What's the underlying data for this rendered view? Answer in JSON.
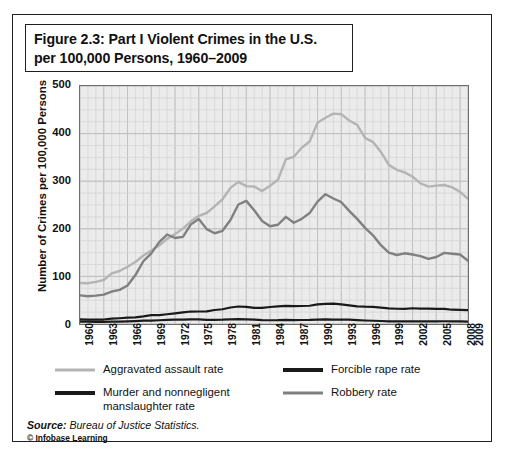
{
  "figure": {
    "title_line1": "Figure 2.3: Part I Violent Crimes in the U.S.",
    "title_line2": "per 100,000 Persons, 1960–2009",
    "source_prefix": "Source:",
    "source_text": " Bureau of Justice Statistics.",
    "copyright": "© Infobase Learning"
  },
  "colors": {
    "aggravated_assault": "#b4b4b4",
    "forcible_rape": "#1a1a1a",
    "murder": "#1a1a1a",
    "robbery": "#808080",
    "plot_background": "#ebebeb",
    "grid": "#d2d2d2",
    "axis": "#6d6d6d",
    "text": "#111111"
  },
  "legend": {
    "items": [
      {
        "label": "Aggravated assault rate",
        "color": "#b4b4b4",
        "width": 3
      },
      {
        "label": "Forcible rape rate",
        "color": "#1a1a1a",
        "width": 4
      },
      {
        "label": "Murder and nonnegligent\nmanslaughter rate",
        "color": "#1a1a1a",
        "width": 4
      },
      {
        "label": "Robbery rate",
        "color": "#808080",
        "width": 3
      }
    ]
  },
  "chart_data": {
    "type": "line",
    "title": "Figure 2.3: Part I Violent Crimes in the U.S. per 100,000 Persons, 1960–2009",
    "xlabel": "",
    "ylabel": "Number of Crimes per 100,000 Persons",
    "ylim": [
      0,
      500
    ],
    "yticks": [
      0,
      100,
      200,
      300,
      400,
      500
    ],
    "xlim": [
      1960,
      2009
    ],
    "xticks": [
      1960,
      1963,
      1966,
      1969,
      1972,
      1975,
      1978,
      1981,
      1984,
      1987,
      1990,
      1993,
      1996,
      1999,
      2002,
      2005,
      2008,
      2009
    ],
    "grid": true,
    "legend_position": "bottom",
    "x": [
      1960,
      1961,
      1962,
      1963,
      1964,
      1965,
      1966,
      1967,
      1968,
      1969,
      1970,
      1971,
      1972,
      1973,
      1974,
      1975,
      1976,
      1977,
      1978,
      1979,
      1980,
      1981,
      1982,
      1983,
      1984,
      1985,
      1986,
      1987,
      1988,
      1989,
      1990,
      1991,
      1992,
      1993,
      1994,
      1995,
      1996,
      1997,
      1998,
      1999,
      2000,
      2001,
      2002,
      2003,
      2004,
      2005,
      2006,
      2007,
      2008,
      2009
    ],
    "series": [
      {
        "name": "Aggravated assault rate",
        "color": "#b4b4b4",
        "values": [
          86.1,
          85.7,
          88.6,
          92.4,
          106.2,
          111.3,
          120.3,
          130.2,
          143.8,
          154.5,
          164.8,
          178.8,
          188.8,
          200.5,
          215.8,
          227.4,
          233.2,
          247.0,
          262.1,
          286.0,
          298.5,
          289.7,
          289.0,
          279.2,
          290.2,
          302.9,
          346.1,
          351.3,
          370.2,
          383.4,
          422.9,
          433.4,
          441.9,
          440.5,
          427.6,
          418.3,
          391.0,
          382.1,
          361.4,
          334.3,
          324.0,
          318.6,
          309.5,
          295.4,
          288.6,
          290.8,
          292.0,
          287.2,
          277.5,
          262.8
        ]
      },
      {
        "name": "Robbery rate",
        "color": "#808080",
        "values": [
          60.1,
          58.3,
          59.7,
          61.8,
          68.2,
          71.7,
          80.8,
          102.8,
          131.8,
          148.4,
          172.1,
          188.0,
          180.7,
          183.1,
          209.3,
          220.8,
          199.3,
          190.7,
          195.8,
          218.4,
          251.1,
          258.7,
          238.9,
          216.5,
          205.4,
          208.5,
          225.1,
          212.7,
          220.9,
          233.0,
          257.0,
          272.7,
          263.6,
          255.9,
          237.7,
          220.9,
          201.9,
          186.2,
          165.5,
          150.1,
          145.0,
          148.5,
          146.1,
          142.5,
          136.7,
          140.8,
          149.4,
          147.6,
          145.9,
          133.0
        ]
      },
      {
        "name": "Forcible rape rate",
        "color": "#1a1a1a",
        "values": [
          9.6,
          9.4,
          9.4,
          9.4,
          11.2,
          12.1,
          13.2,
          14.0,
          15.9,
          18.5,
          18.7,
          20.5,
          22.5,
          24.5,
          26.2,
          26.3,
          26.6,
          29.4,
          31.0,
          34.7,
          36.8,
          36.0,
          34.0,
          33.7,
          35.7,
          37.1,
          38.1,
          37.4,
          37.8,
          38.3,
          41.2,
          42.3,
          42.8,
          41.1,
          39.3,
          37.1,
          36.3,
          35.9,
          34.5,
          32.8,
          32.0,
          31.8,
          33.1,
          32.3,
          32.4,
          31.8,
          31.6,
          30.0,
          29.8,
          29.0
        ]
      },
      {
        "name": "Murder and nonnegligent manslaughter rate",
        "color": "#1a1a1a",
        "values": [
          5.1,
          4.8,
          4.6,
          4.6,
          4.9,
          5.1,
          5.6,
          6.2,
          6.9,
          7.3,
          7.9,
          8.6,
          9.0,
          9.4,
          9.8,
          9.6,
          8.8,
          8.8,
          9.0,
          9.7,
          10.2,
          9.8,
          9.1,
          8.3,
          7.9,
          8.0,
          8.6,
          8.3,
          8.4,
          8.7,
          9.4,
          9.8,
          9.3,
          9.5,
          9.0,
          8.2,
          7.4,
          6.8,
          6.3,
          5.7,
          5.5,
          5.6,
          5.6,
          5.7,
          5.5,
          5.6,
          5.8,
          5.7,
          5.4,
          5.0
        ]
      }
    ]
  }
}
